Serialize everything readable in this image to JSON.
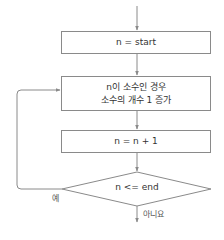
{
  "diagram": {
    "type": "flowchart",
    "nodes": [
      {
        "id": "init",
        "shape": "rect",
        "label": "n = start"
      },
      {
        "id": "check_prime",
        "shape": "rect",
        "lines": [
          "n이 소수인 경우",
          "소수의 개수 1 증가"
        ]
      },
      {
        "id": "increment",
        "shape": "rect",
        "label": "n = n + 1"
      },
      {
        "id": "condition",
        "shape": "diamond",
        "label": "n <= end"
      }
    ],
    "edges": [
      {
        "from": "entry",
        "to": "init"
      },
      {
        "from": "init",
        "to": "check_prime"
      },
      {
        "from": "check_prime",
        "to": "increment"
      },
      {
        "from": "increment",
        "to": "condition"
      },
      {
        "from": "condition",
        "to": "check_prime",
        "label": "예"
      },
      {
        "from": "condition",
        "to": "exit",
        "label": "아니요"
      }
    ],
    "colors": {
      "line": "#8a8a8a",
      "text": "#333333"
    }
  }
}
